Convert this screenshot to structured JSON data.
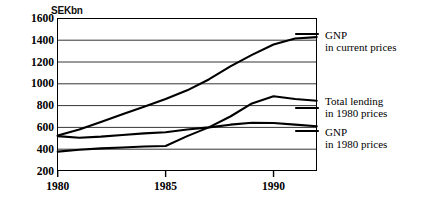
{
  "chart_data": {
    "type": "line",
    "title": "",
    "subtitle": "",
    "unit_caption": "SEKbn",
    "xlabel": "",
    "ylabel": "SEKbn",
    "xlim": [
      1980,
      1992
    ],
    "ylim": [
      200,
      1600
    ],
    "y_ticks": [
      1600,
      1400,
      1200,
      1000,
      800,
      600,
      400,
      200
    ],
    "x_ticks": [
      1980,
      1985,
      1990
    ],
    "x_tick_labels": [
      "1980",
      "1985",
      "1990"
    ],
    "grid": "horizontal",
    "legend_position": "right",
    "x": [
      1980,
      1981,
      1982,
      1983,
      1984,
      1985,
      1986,
      1987,
      1988,
      1989,
      1990,
      1991,
      1992
    ],
    "series": [
      {
        "name": "GNP in current prices",
        "label_line1": "GNP",
        "label_line2": "in current prices",
        "color": "#000000",
        "values": [
          525,
          580,
          650,
          720,
          790,
          860,
          940,
          1040,
          1160,
          1265,
          1360,
          1415,
          1428
        ]
      },
      {
        "name": "Total lending in 1980 prices",
        "label_line1": "Total lending",
        "label_line2": "in 1980 prices",
        "color": "#000000",
        "values": [
          378,
          395,
          408,
          415,
          425,
          430,
          520,
          600,
          700,
          820,
          885,
          860,
          845
        ]
      },
      {
        "name": "GNP in 1980 prices",
        "label_line1": "GNP",
        "label_line2": "in 1980 prices",
        "color": "#000000",
        "values": [
          520,
          505,
          515,
          530,
          545,
          555,
          580,
          600,
          625,
          643,
          640,
          625,
          610
        ]
      }
    ]
  },
  "legend": {
    "entries": [
      {
        "line1": "GNP",
        "line2": "in current prices"
      },
      {
        "line1": "Total lending",
        "line2": "in 1980 prices"
      },
      {
        "line1": "GNP",
        "line2": "in 1980 prices"
      }
    ]
  }
}
